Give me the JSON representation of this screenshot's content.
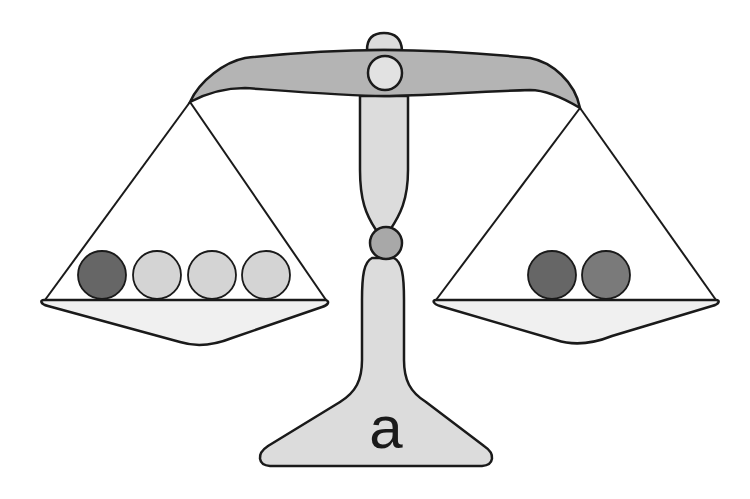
{
  "diagram": {
    "type": "balance-scale",
    "label": "a",
    "colors": {
      "beam": "#b4b4b4",
      "column": "#dcdcdc",
      "pivot": "#e2e2e2",
      "joint": "#a8a8a8",
      "pan": "#f0f0f0",
      "stroke": "#1a1a1a",
      "ball_dark": "#6a6a6a",
      "ball_medium": "#7a7a7a",
      "ball_light": "#d2d2d2"
    },
    "left_pan": {
      "balls": [
        {
          "shade": "dark",
          "color": "#666666"
        },
        {
          "shade": "light",
          "color": "#d4d4d4"
        },
        {
          "shade": "light",
          "color": "#d4d4d4"
        },
        {
          "shade": "light",
          "color": "#d4d4d4"
        }
      ]
    },
    "right_pan": {
      "balls": [
        {
          "shade": "dark",
          "color": "#666666"
        },
        {
          "shade": "medium-dark",
          "color": "#7a7a7a"
        }
      ]
    }
  }
}
